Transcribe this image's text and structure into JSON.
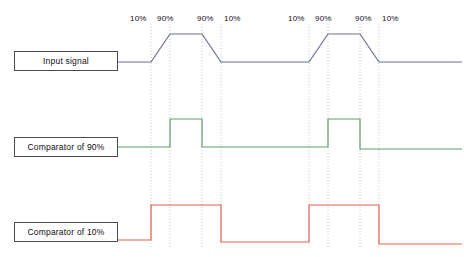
{
  "diagram": {
    "colors": {
      "input_signal": "#6b6f94",
      "comparator_90": "#5f9e6e",
      "comparator_10": "#e2614c",
      "guide_line": "#b9c4b9",
      "box_border": "#4a4a55",
      "text": "#0d0d12",
      "background": "#ffffff"
    },
    "labels": [
      {
        "name": "input-signal",
        "text": "Input signal",
        "x": 14,
        "y": 51,
        "width": 104,
        "height": 20
      },
      {
        "name": "comparator-90",
        "text": "Comparator of 90%",
        "x": 14,
        "y": 137,
        "width": 104,
        "height": 20
      },
      {
        "name": "comparator-10",
        "text": "Comparator of 10%",
        "x": 14,
        "y": 222,
        "width": 104,
        "height": 20
      }
    ],
    "percent_annotations": [
      {
        "text": "10%",
        "x": 130,
        "y": 15
      },
      {
        "text": "90%",
        "x": 157,
        "y": 15
      },
      {
        "text": "90%",
        "x": 197,
        "y": 15
      },
      {
        "text": "10%",
        "x": 224,
        "y": 15
      },
      {
        "text": "10%",
        "x": 288,
        "y": 15
      },
      {
        "text": "90%",
        "x": 315,
        "y": 15
      },
      {
        "text": "90%",
        "x": 355,
        "y": 15
      },
      {
        "text": "10%",
        "x": 382,
        "y": 15
      }
    ],
    "guide_lines_x": [
      151,
      170,
      202,
      221,
      309,
      328,
      360,
      379
    ],
    "guide_line_top": 24,
    "guide_line_bottom": 249,
    "traces": {
      "input_signal": {
        "name": "input-signal-trace",
        "baseline_low_y": 62,
        "baseline_high_y": 34,
        "points": "118,62 151,62 170,34 202,34 221,62 309,62 328,34 360,34 379,62 462,62"
      },
      "comparator_90": {
        "name": "comparator-90-trace",
        "baseline_low_y": 147,
        "baseline_high_y": 119,
        "points": "118,147 170,147 170,119 202,119 202,147 328,147 328,119 360,119 360,149 462,149"
      },
      "comparator_10": {
        "name": "comparator-10-trace",
        "baseline_low_y": 240,
        "baseline_high_y": 205,
        "points": "118,240 151,240 151,205 221,205 221,242 309,242 309,205 379,205 379,244 462,244"
      }
    },
    "connectors": [
      {
        "name": "input-signal-connector",
        "x1": 118,
        "y1": 62,
        "x2": 151,
        "y2": 62
      },
      {
        "name": "comparator-90-connector",
        "x1": 118,
        "y1": 147,
        "x2": 170,
        "y2": 147
      },
      {
        "name": "comparator-10-connector",
        "x1": 118,
        "y1": 240,
        "x2": 151,
        "y2": 240
      }
    ]
  }
}
